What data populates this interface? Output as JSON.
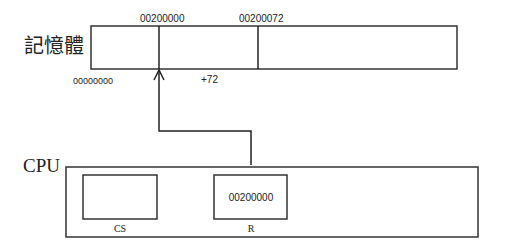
{
  "memory": {
    "label": "記憶體",
    "base_address_label": "00000000",
    "segment_start_label": "00200000",
    "target_address_label": "00200072",
    "offset_label": "+72"
  },
  "cpu": {
    "label": "CPU",
    "registers": [
      {
        "name": "CS",
        "value": ""
      },
      {
        "name": "R",
        "value": "00200000"
      }
    ]
  },
  "arrow": {
    "from": "R",
    "to": "00200000",
    "meaning": "register R points to memory address"
  }
}
